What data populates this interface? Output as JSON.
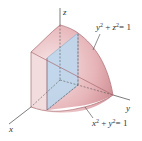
{
  "diagram": {
    "type": "3d-solid",
    "axes": {
      "x_label": "x",
      "y_label": "y",
      "z_label": "z"
    },
    "surfaces": [
      {
        "equation": "y² + z² = 1",
        "sup_base1": "y",
        "sup_base2": "z",
        "exp": "2",
        "rhs": "= 1"
      },
      {
        "equation": "x² + y² = 1",
        "sup_base1": "x",
        "sup_base2": "y",
        "exp": "2",
        "rhs": "= 1"
      }
    ],
    "colors": {
      "solid_fill": "#f2d6d8",
      "solid_dark": "#d79aa0",
      "cross_section": "#bcd6ec",
      "edge": "#a86a70",
      "axis": "#444444"
    }
  }
}
